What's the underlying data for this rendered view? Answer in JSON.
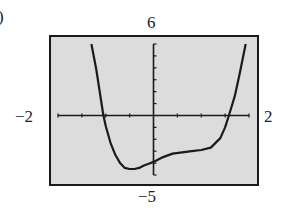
{
  "panel_label": ")",
  "window": {
    "xmin_label": "−2",
    "xmax_label": "2",
    "ymax_label": "6",
    "ymin_label": "−5"
  },
  "colors": {
    "background": "#ffffff",
    "screen": "#dcdcdc",
    "ink": "#1a1a1a"
  },
  "chart_data": {
    "type": "line",
    "title": "",
    "xlabel": "",
    "ylabel": "",
    "xlim": [
      -2,
      2
    ],
    "ylim": [
      -5,
      6
    ],
    "x_tick_labels": [
      "-2",
      "2"
    ],
    "y_tick_labels": [
      "-5",
      "6"
    ],
    "x_scale_ticks": 0.5,
    "y_scale_ticks": 1,
    "grid": false,
    "legend": null,
    "series": [
      {
        "name": "f(x)",
        "x": [
          -1.3,
          -1.2,
          -1.1,
          -1.05,
          -1.0,
          -0.9,
          -0.8,
          -0.7,
          -0.6,
          -0.5,
          -0.4,
          -0.3,
          -0.2,
          -0.1,
          0.0,
          0.2,
          0.4,
          0.6,
          0.8,
          1.0,
          1.2,
          1.4,
          1.5,
          1.58,
          1.7,
          1.8,
          1.93
        ],
        "y": [
          6.0,
          3.9,
          1.3,
          0.0,
          -0.9,
          -2.3,
          -3.3,
          -4.0,
          -4.4,
          -4.5,
          -4.5,
          -4.4,
          -4.2,
          -4.05,
          -3.9,
          -3.5,
          -3.2,
          -3.1,
          -3.0,
          -2.9,
          -2.7,
          -1.9,
          -1.0,
          0.0,
          1.6,
          3.4,
          6.0
        ]
      }
    ],
    "annotations": []
  }
}
